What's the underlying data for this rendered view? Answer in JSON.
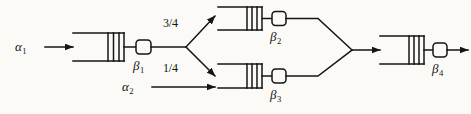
{
  "diagram": {
    "type": "queueing-network",
    "background_color": "#fbfaf7",
    "line_color": "#141414",
    "arrivals": [
      {
        "id": "alpha1",
        "label": "α",
        "subscript": "1",
        "target": "queue-beta1"
      },
      {
        "id": "alpha2",
        "label": "α",
        "subscript": "2",
        "target": "queue-beta3"
      }
    ],
    "nodes": [
      {
        "id": "queue-beta1",
        "label": "β",
        "subscript": "1",
        "buffer_bars": 3,
        "server": "rounded-square"
      },
      {
        "id": "queue-beta2",
        "label": "β",
        "subscript": "2",
        "buffer_bars": 3,
        "server": "rounded-square"
      },
      {
        "id": "queue-beta3",
        "label": "β",
        "subscript": "3",
        "buffer_bars": 3,
        "server": "rounded-square"
      },
      {
        "id": "queue-beta4",
        "label": "β",
        "subscript": "4",
        "buffer_bars": 3,
        "server": "rounded-square"
      }
    ],
    "branch_probabilities": [
      {
        "id": "prob-upper",
        "label": "3/4",
        "from": "queue-beta1",
        "to": "queue-beta2"
      },
      {
        "id": "prob-lower",
        "label": "1/4",
        "from": "queue-beta1",
        "to": "queue-beta3"
      }
    ],
    "merge": {
      "from": [
        "queue-beta2",
        "queue-beta3"
      ],
      "to": "queue-beta4"
    },
    "departure": {
      "id": "departure-arrow",
      "from": "queue-beta4"
    }
  }
}
